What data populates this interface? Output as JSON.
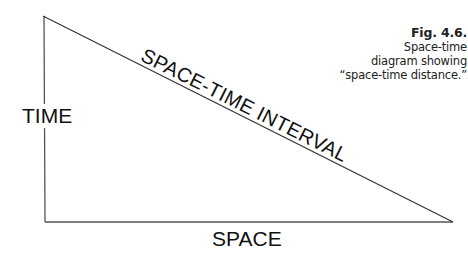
{
  "figure": {
    "caption": {
      "number": "Fig. 4.6.",
      "lines": [
        "Space-time",
        "diagram showing",
        "“space-time distance.”"
      ]
    },
    "labels": {
      "vertical_axis": "TIME",
      "horizontal_axis": "SPACE",
      "hypotenuse": "SPACE-TIME INTERVAL"
    },
    "triangle": {
      "vertices": [
        [
          43,
          16
        ],
        [
          45,
          222
        ],
        [
          453,
          222
        ]
      ],
      "stroke_color": "#555555"
    }
  }
}
